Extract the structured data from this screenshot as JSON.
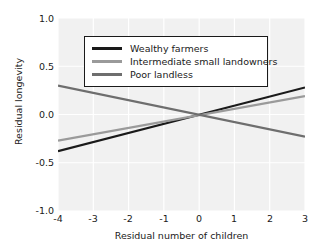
{
  "chart_data": {
    "type": "line",
    "title": "",
    "xlabel": "Residual number of children",
    "ylabel": "Residual longevity",
    "xlim": [
      -4,
      3
    ],
    "ylim": [
      -1.0,
      1.0
    ],
    "xticks": [
      "-4",
      "-3",
      "-2",
      "-1",
      "0",
      "1",
      "2",
      "3"
    ],
    "xtick_values": [
      -4,
      -3,
      -2,
      -1,
      0,
      1,
      2,
      3
    ],
    "yticks": [
      "1.0",
      "0.5",
      "0.0",
      "-0.5",
      "-1.0"
    ],
    "ytick_values": [
      1.0,
      0.5,
      0.0,
      -0.5,
      -1.0
    ],
    "grid": true,
    "legend_position": "upper center",
    "x": [
      -4,
      3
    ],
    "series": [
      {
        "name": "Wealthy farmers",
        "color": "#1a1a1a",
        "values": [
          -0.38,
          0.28
        ],
        "slope": 0.0943,
        "intercept": -0.0029
      },
      {
        "name": "Intermediate small landowners",
        "color": "#9a9a9a",
        "values": [
          -0.27,
          0.19
        ],
        "slope": 0.0657,
        "intercept": -0.0071
      },
      {
        "name": "Poor landless",
        "color": "#6e6e6e",
        "values": [
          0.3,
          -0.23
        ],
        "slope": -0.0757,
        "intercept": -0.0029
      }
    ]
  },
  "legend": {
    "items": [
      {
        "label": "Wealthy farmers"
      },
      {
        "label": "Intermediate small landowners"
      },
      {
        "label": "Poor landless"
      }
    ]
  }
}
